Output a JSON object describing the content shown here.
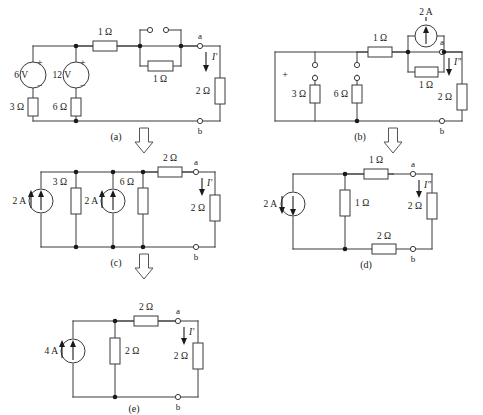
{
  "figure": {
    "subfigures": [
      {
        "id": "a",
        "caption": "(a)",
        "current_label": "I'",
        "node_a": "a",
        "node_b": "b",
        "sources": [
          {
            "name": "source-6v",
            "value": "6 V",
            "plus": "+",
            "minus": "−",
            "type": "voltage"
          },
          {
            "name": "source-12v",
            "value": "12 V",
            "plus": "+",
            "minus": "−",
            "type": "voltage"
          }
        ],
        "resistors": [
          {
            "name": "resistor-3ohm",
            "value": "3 Ω"
          },
          {
            "name": "resistor-6ohm",
            "value": "6 Ω"
          },
          {
            "name": "resistor-1ohm-series",
            "value": "1 Ω"
          },
          {
            "name": "resistor-1ohm-parallel",
            "value": "1 Ω"
          },
          {
            "name": "resistor-2ohm-load",
            "value": "2 Ω"
          }
        ],
        "switch": {
          "name": "open-switch",
          "state": "open"
        }
      },
      {
        "id": "b",
        "caption": "(b)",
        "current_label": "I″",
        "node_a": "a",
        "node_b": "b",
        "polarity_mark": "+",
        "sources": [
          {
            "name": "source-2a",
            "value": "2 A",
            "type": "current",
            "direction": "up"
          }
        ],
        "resistors": [
          {
            "name": "resistor-3ohm",
            "value": "3 Ω"
          },
          {
            "name": "resistor-6ohm",
            "value": "6 Ω"
          },
          {
            "name": "resistor-1ohm-series",
            "value": "1 Ω"
          },
          {
            "name": "resistor-1ohm-parallel",
            "value": "1 Ω"
          },
          {
            "name": "resistor-2ohm-load",
            "value": "2 Ω"
          }
        ]
      },
      {
        "id": "c",
        "caption": "(c)",
        "current_label": "I'",
        "node_a": "a",
        "node_b": "b",
        "sources": [
          {
            "name": "source-2a-left",
            "value": "2 A",
            "type": "current",
            "direction": "up"
          },
          {
            "name": "source-2a-mid",
            "value": "2 A",
            "type": "current",
            "direction": "up"
          }
        ],
        "resistors": [
          {
            "name": "resistor-3ohm",
            "value": "3 Ω"
          },
          {
            "name": "resistor-6ohm",
            "value": "6 Ω"
          },
          {
            "name": "resistor-2ohm-series",
            "value": "2 Ω"
          },
          {
            "name": "resistor-2ohm-load",
            "value": "2 Ω"
          }
        ]
      },
      {
        "id": "d",
        "caption": "(d)",
        "current_label": "I″",
        "node_a": "a",
        "node_b": "b",
        "sources": [
          {
            "name": "source-2a",
            "value": "2 A",
            "type": "current",
            "direction": "down"
          }
        ],
        "resistors": [
          {
            "name": "resistor-1ohm-series",
            "value": "1 Ω"
          },
          {
            "name": "resistor-1ohm-shunt",
            "value": "1 Ω"
          },
          {
            "name": "resistor-2ohm-load",
            "value": "2 Ω"
          },
          {
            "name": "resistor-2ohm-bottom",
            "value": "2 Ω"
          }
        ]
      },
      {
        "id": "e",
        "caption": "(e)",
        "current_label": "I'",
        "node_a": "a",
        "node_b": "b",
        "sources": [
          {
            "name": "source-4a",
            "value": "4 A",
            "type": "current",
            "direction": "up"
          }
        ],
        "resistors": [
          {
            "name": "resistor-2ohm-shunt",
            "value": "2 Ω"
          },
          {
            "name": "resistor-2ohm-series",
            "value": "2 Ω"
          },
          {
            "name": "resistor-2ohm-load",
            "value": "2 Ω"
          }
        ]
      }
    ],
    "flow_arrows": [
      {
        "name": "flow-arrow-a-to-c",
        "direction": "down"
      },
      {
        "name": "flow-arrow-b-to-d",
        "direction": "down"
      },
      {
        "name": "flow-arrow-c-to-e",
        "direction": "down"
      }
    ]
  }
}
